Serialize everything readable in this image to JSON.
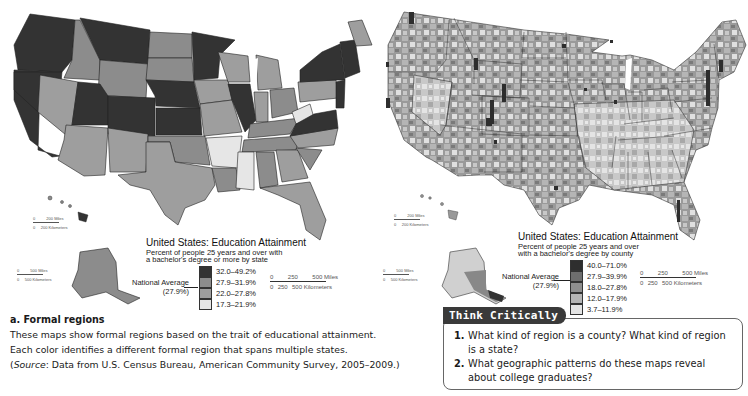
{
  "maps": {
    "left": {
      "title": "United States:  Education Attainment",
      "subtitle_line1": "Percent of people 25 years and over with",
      "subtitle_line2": "a bachelor's degree or more by state",
      "national_average_label": "National Average",
      "national_average_value": "(27.9%)",
      "legend": [
        {
          "label": "32.0–49.2%",
          "color": "#333333"
        },
        {
          "label": "27.9–31.9%",
          "color": "#8c8c8c"
        },
        {
          "label": "22.0–27.8%",
          "color": "#9e9e9e"
        },
        {
          "label": "17.3–21.9%",
          "color": "#e6e6e6"
        }
      ],
      "hawaii_scale": {
        "miles": "200 Miles",
        "km": "200 Kilometers",
        "zero": "0"
      },
      "alaska_scale": {
        "miles": "500 Miles",
        "km": "500 Kilometers",
        "zero": "0"
      },
      "main_scale": {
        "zero": "0",
        "m250": "250",
        "m500": "500 Miles",
        "k250": "250",
        "k500": "500 Kilometers"
      }
    },
    "right": {
      "title": "United States:  Education Attainment",
      "subtitle_line1": "Percent of people 25 years and over",
      "subtitle_line2": "with a bachelor's degree by county",
      "national_average_label": "National Average",
      "national_average_value": "(27.9%)",
      "legend": [
        {
          "label": "40.0–71.0%",
          "color": "#2e2e2e"
        },
        {
          "label": "27.9–39.9%",
          "color": "#6e6e6e"
        },
        {
          "label": "18.0–27.8%",
          "color": "#8f8f8f"
        },
        {
          "label": "12.0–17.9%",
          "color": "#b5b5b5"
        },
        {
          "label": "3.7–11.9%",
          "color": "#e4e4e4"
        }
      ],
      "hawaii_scale": {
        "miles": "200 Miles",
        "km": "200 Kilometers",
        "zero": "0"
      },
      "alaska_scale": {
        "miles": "500 Miles",
        "km": "500 Kilometers",
        "zero": "0"
      },
      "main_scale": {
        "zero": "0",
        "m250": "250",
        "m500": "500 Miles",
        "k250": "250",
        "k500": "500 Kilometers"
      }
    }
  },
  "caption": {
    "heading": "a. Formal regions",
    "line1": "These maps show formal regions based on the trait of educational attainment.",
    "line2": "Each color identifies a different formal region that spans multiple states.",
    "source_label": "Source",
    "source_text": ": Data from U.S. Census Bureau, American Community Survey, 2005–2009.)",
    "source_open": "("
  },
  "think_critically": {
    "title": "Think Critically",
    "questions": [
      {
        "num": "1.",
        "text": "What kind of region is a county? What kind of region is a state?"
      },
      {
        "num": "2.",
        "text": "What geographic patterns do these maps reveal about college graduates?"
      }
    ]
  }
}
